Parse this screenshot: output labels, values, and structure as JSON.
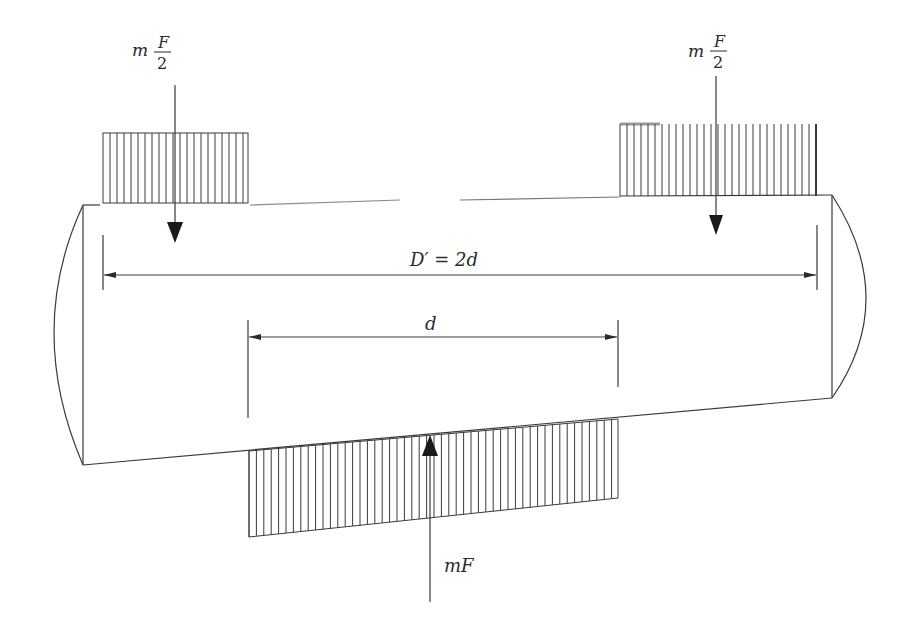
{
  "diagram": {
    "type": "free-body diagram of a disc/bolt joint with distributed pressure loads",
    "labels": {
      "left_force": {
        "coef": "m",
        "numerator": "F",
        "denominator": "2"
      },
      "right_force": {
        "coef": "m",
        "numerator": "F",
        "denominator": "2"
      },
      "bottom_force": "mF",
      "outer_dimension": "D′ = 2d",
      "inner_dimension": "d"
    },
    "colors": {
      "line": "#3a3a3a",
      "text": "#2a2a2a",
      "background": "#ffffff"
    }
  }
}
